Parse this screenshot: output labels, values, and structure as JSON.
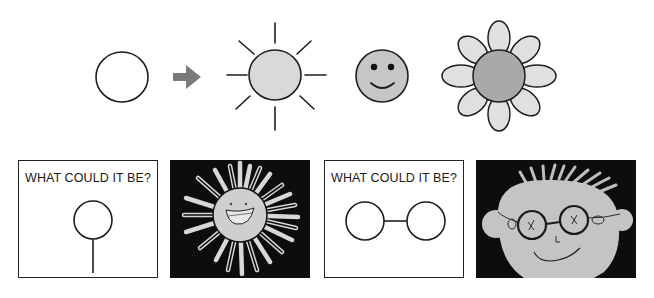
{
  "top_row": {
    "items": [
      {
        "id": "circle",
        "label": "plain circle"
      },
      {
        "id": "arrow",
        "label": "transform arrow"
      },
      {
        "id": "sun",
        "label": "sun with rays"
      },
      {
        "id": "smiley",
        "label": "smiley face"
      },
      {
        "id": "flower",
        "label": "flower"
      }
    ],
    "colors": {
      "stroke": "#1e1e1e",
      "arrow": "#7a7a7a",
      "sun_fill": "#d9d9d9",
      "smiley_fill": "#c6c6c6",
      "flower_center": "#a9a9a9",
      "flower_petal": "#e0e0e0"
    }
  },
  "bottom_row": {
    "panels": [
      {
        "type": "prompt",
        "text": "WHAT COULD IT BE?",
        "shape": "circle on a stick"
      },
      {
        "type": "drawing",
        "subject": "child's drawing of smiling sun"
      },
      {
        "type": "prompt",
        "text": "WHAT COULD IT BE?",
        "shape": "two circles joined by a line"
      },
      {
        "type": "drawing",
        "subject": "child's drawing of face with glasses"
      }
    ]
  }
}
